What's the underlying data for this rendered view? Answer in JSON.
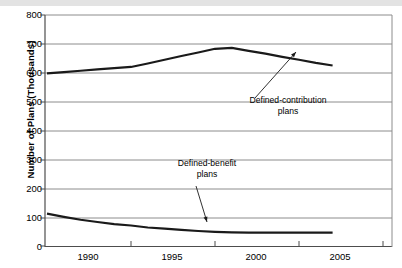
{
  "chart_data": {
    "type": "line",
    "title": "",
    "xlabel": "",
    "ylabel": "Number of Plans (Thousands)",
    "xlim": [
      1989,
      2007
    ],
    "ylim": [
      0,
      800
    ],
    "yticks": [
      0,
      100,
      200,
      300,
      400,
      500,
      600,
      700,
      800
    ],
    "xticks": [
      1990,
      1995,
      2000,
      2005
    ],
    "grid": true,
    "legend": "annotations",
    "series": [
      {
        "name": "Defined-contribution plans",
        "color": "#1a1a1a",
        "x": [
          1990,
          1991,
          1992,
          1993,
          1994,
          1995,
          1996,
          1997,
          1998,
          1999,
          2000,
          2001,
          2002,
          2003,
          2004,
          2005,
          2006,
          2007
        ],
        "values": [
          598,
          602,
          607,
          612,
          616,
          620,
          632,
          645,
          658,
          670,
          683,
          686,
          676,
          666,
          655,
          645,
          634,
          625
        ]
      },
      {
        "name": "Defined-benefit plans",
        "color": "#1a1a1a",
        "x": [
          1990,
          1991,
          1992,
          1993,
          1994,
          1995,
          1996,
          1997,
          1998,
          1999,
          2000,
          2001,
          2002,
          2003,
          2004,
          2005,
          2006,
          2007
        ],
        "values": [
          112,
          101,
          91,
          83,
          76,
          71,
          64,
          60,
          56,
          52,
          49,
          47,
          46,
          46,
          46,
          46,
          46,
          46
        ]
      }
    ],
    "annotations": [
      {
        "id": "defined-contribution",
        "line1": "Defined-contribution",
        "line2": "plans",
        "text_x": 288,
        "text_y": 101,
        "arrow_from_x": 255,
        "arrow_from_y": 98,
        "arrow_to_x": 296,
        "arrow_to_y": 52
      },
      {
        "id": "defined-benefit",
        "line1": "Defined-benefit",
        "line2": "plans",
        "text_x": 207,
        "text_y": 164,
        "arrow_from_x": 196,
        "arrow_from_y": 186,
        "arrow_to_x": 207,
        "arrow_to_y": 222
      }
    ]
  },
  "axis": {
    "y_ticks_labels": [
      "800",
      "700",
      "600",
      "500",
      "400",
      "300",
      "200",
      "100",
      "0"
    ],
    "x_ticks_labels": [
      "1990",
      "1995",
      "2000",
      "2005"
    ],
    "y_axis_title": "Number of Plans (Thousands)"
  },
  "colors": {
    "series_line": "#1a1a1a",
    "grid": "#8c8c8c",
    "axis": "#4d4d4d",
    "topbar": "#e3e3e3",
    "text": "#000000"
  }
}
